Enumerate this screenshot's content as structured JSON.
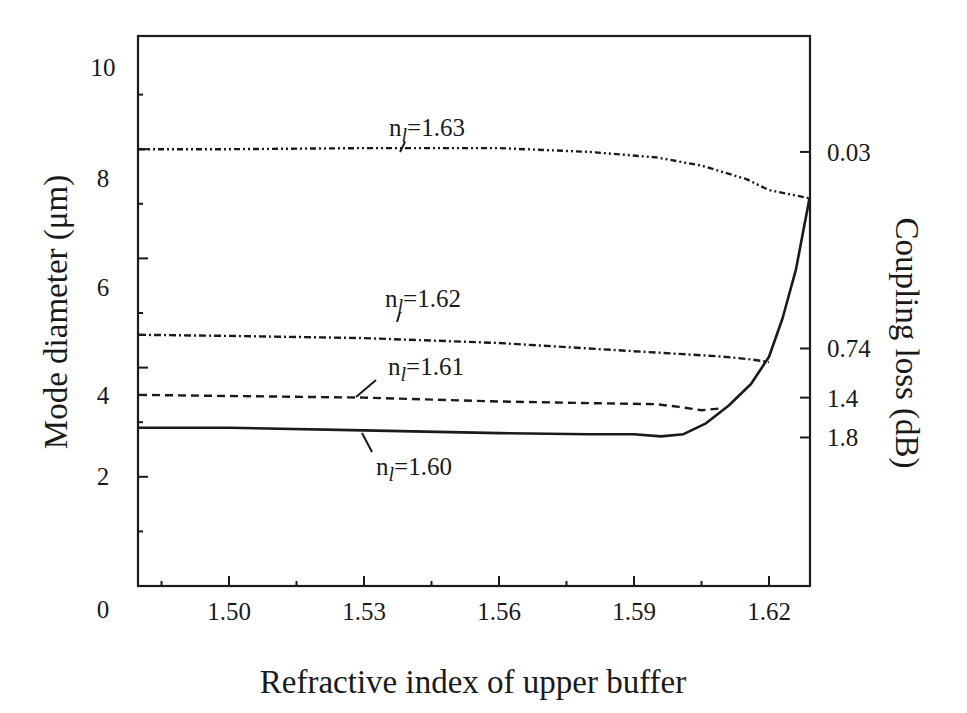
{
  "chart_data": {
    "type": "line",
    "title": "",
    "xlabel": "Refractive index of upper buffer",
    "ylabel": "Mode diameter (μm)",
    "y2label": "Coupling loss (dB)",
    "xlim": [
      1.48,
      1.629
    ],
    "ylim": [
      0,
      10
    ],
    "x_ticks": [
      "1.50",
      "1.53",
      "1.56",
      "1.59",
      "1.62"
    ],
    "y_ticks": [
      "0",
      "2",
      "4",
      "6",
      "8",
      "10"
    ],
    "y2_ticks": [
      {
        "label": "0.03",
        "at_mode_diameter": 7.95
      },
      {
        "label": "0.74",
        "at_mode_diameter": 4.35
      },
      {
        "label": "1.4",
        "at_mode_diameter": 3.45
      },
      {
        "label": "1.8",
        "at_mode_diameter": 2.72
      }
    ],
    "grid": false,
    "legend": "inline labels",
    "series": [
      {
        "name": "nl=1.63",
        "label_main": "n",
        "label_sub": "l",
        "label_value": "=1.63",
        "style": "dash-dot-dot",
        "x": [
          1.48,
          1.5,
          1.53,
          1.56,
          1.58,
          1.595,
          1.605,
          1.615,
          1.62,
          1.629
        ],
        "y": [
          8.0,
          8.0,
          8.02,
          8.02,
          7.95,
          7.85,
          7.7,
          7.45,
          7.25,
          7.1
        ]
      },
      {
        "name": "nl=1.62",
        "label_main": "n",
        "label_sub": "l",
        "label_value": "=1.62",
        "style": "dash-dot",
        "x": [
          1.48,
          1.5,
          1.53,
          1.56,
          1.58,
          1.6,
          1.61,
          1.616,
          1.62
        ],
        "y": [
          4.6,
          4.58,
          4.54,
          4.45,
          4.35,
          4.25,
          4.2,
          4.15,
          4.1
        ]
      },
      {
        "name": "nl=1.61",
        "label_main": "n",
        "label_sub": "l",
        "label_value": "=1.61",
        "style": "dashed",
        "x": [
          1.48,
          1.5,
          1.53,
          1.56,
          1.58,
          1.595,
          1.6,
          1.605,
          1.609
        ],
        "y": [
          3.5,
          3.48,
          3.45,
          3.38,
          3.35,
          3.33,
          3.28,
          3.22,
          3.25
        ]
      },
      {
        "name": "nl=1.60",
        "label_main": "n",
        "label_sub": "l",
        "label_value": "=1.60",
        "style": "solid",
        "x": [
          1.48,
          1.5,
          1.53,
          1.56,
          1.58,
          1.59,
          1.596,
          1.601,
          1.606,
          1.611,
          1.616,
          1.62,
          1.623,
          1.626,
          1.629
        ],
        "y": [
          2.9,
          2.9,
          2.85,
          2.8,
          2.78,
          2.78,
          2.74,
          2.78,
          2.98,
          3.3,
          3.7,
          4.2,
          4.9,
          5.8,
          7.1
        ]
      }
    ]
  },
  "axes": {
    "left_title": "Mode diameter (μm)",
    "right_title": "Coupling loss (dB)",
    "bottom_title": "Refractive index of upper buffer"
  }
}
